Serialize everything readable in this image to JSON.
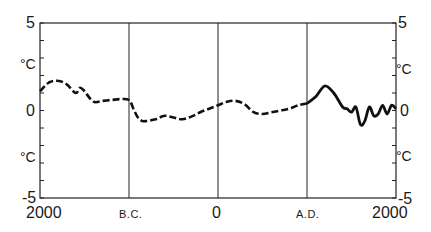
{
  "chart_data": {
    "type": "line",
    "title": "",
    "xlabel": "",
    "ylabel": "°C",
    "ylim": [
      -5,
      5
    ],
    "xlim": [
      -2000,
      2000
    ],
    "grid": false,
    "legend": null,
    "x_tick_labels": [
      {
        "x": -2000,
        "label": "2000"
      },
      {
        "x": -1000,
        "label": "B.C."
      },
      {
        "x": 0,
        "label": "0"
      },
      {
        "x": 1000,
        "label": "A.D."
      },
      {
        "x": 2000,
        "label": "2000"
      }
    ],
    "vertical_lines_at": [
      -1000,
      0,
      1000
    ],
    "y_tick_labels": {
      "left": [
        {
          "y": 5,
          "label": "5"
        },
        {
          "y": 2.5,
          "label": "°C"
        },
        {
          "y": 0,
          "label": "0"
        },
        {
          "y": -2.5,
          "label": "°C"
        },
        {
          "y": -5,
          "label": "-5"
        }
      ],
      "right": [
        {
          "y": 5,
          "label": "5"
        },
        {
          "y": 2.5,
          "label": "°C"
        },
        {
          "y": 0,
          "label": "0"
        },
        {
          "y": -2.5,
          "label": "°C"
        },
        {
          "y": -5,
          "label": "-5"
        }
      ]
    },
    "series": [
      {
        "name": "Temperature anomaly (reconstructed)",
        "style": "dashed",
        "x": [
          -2000,
          -1900,
          -1800,
          -1700,
          -1600,
          -1550,
          -1500,
          -1400,
          -1300,
          -1200,
          -1100,
          -1000,
          -950,
          -900,
          -850,
          -800,
          -700,
          -600,
          -500,
          -400,
          -300,
          -200,
          -100,
          0,
          100,
          200,
          300,
          400,
          500,
          600,
          700,
          800,
          900,
          1000
        ],
        "values": [
          1.1,
          1.6,
          1.7,
          1.5,
          1.0,
          1.3,
          1.1,
          0.5,
          0.55,
          0.6,
          0.65,
          0.6,
          0.1,
          -0.4,
          -0.6,
          -0.6,
          -0.5,
          -0.3,
          -0.4,
          -0.5,
          -0.35,
          -0.1,
          0.1,
          0.3,
          0.5,
          0.55,
          0.35,
          -0.1,
          -0.2,
          -0.1,
          0.0,
          0.1,
          0.3,
          0.4
        ]
      },
      {
        "name": "Temperature anomaly (recent)",
        "style": "solid",
        "x": [
          1000,
          1100,
          1200,
          1300,
          1400,
          1450,
          1500,
          1550,
          1600,
          1650,
          1700,
          1750,
          1800,
          1850,
          1900,
          1950,
          2000
        ],
        "values": [
          0.4,
          0.8,
          1.4,
          1.0,
          0.2,
          0.1,
          -0.1,
          0.2,
          -0.8,
          -0.6,
          0.2,
          -0.3,
          -0.2,
          0.3,
          -0.2,
          0.3,
          0.1
        ]
      }
    ]
  },
  "axis": {
    "left_labels": [
      "5",
      "°C",
      "0",
      "°C",
      "-5"
    ],
    "right_labels": [
      "5",
      "°C",
      "0",
      "°C",
      "-5"
    ],
    "x_labels": [
      "2000",
      "B.C.",
      "0",
      "A.D.",
      "2000"
    ]
  }
}
